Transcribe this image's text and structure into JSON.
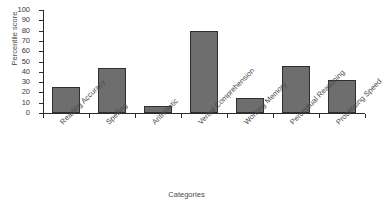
{
  "chart_data": {
    "type": "bar",
    "title": "",
    "xlabel": "Categories",
    "ylabel": "Percentile score",
    "categories": [
      "Reading Accuracy",
      "Spelling",
      "Arithmetic",
      "Verbal Comprehension",
      "Working Memory",
      "Perceptual Reasoning",
      "Processing Speed"
    ],
    "values": [
      25,
      44,
      7,
      80,
      15,
      46,
      32
    ],
    "ylim": [
      0,
      100
    ],
    "ytick_labels": [
      "100",
      "90",
      "80",
      "70",
      "60",
      "50",
      "40",
      "30",
      "20",
      "10",
      "0"
    ],
    "ytick_values": [
      100,
      90,
      80,
      70,
      60,
      50,
      40,
      30,
      20,
      10,
      0
    ],
    "grid": false,
    "legend": false,
    "bar_color": "#6e6e6e",
    "bar_edge_color": "#2f2f2f",
    "axis_color": "#2b2b2b",
    "background_color": "#ffffff"
  }
}
